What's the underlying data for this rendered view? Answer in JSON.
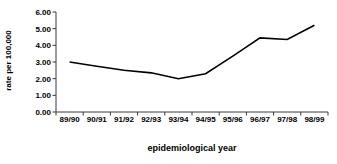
{
  "chart_data": {
    "type": "line",
    "title": "",
    "subtitle": "",
    "xlabel": "epidemiological year",
    "ylabel": "rate per 100,000",
    "categories": [
      "89/90",
      "90/91",
      "91/92",
      "92/93",
      "93/94",
      "94/95",
      "95/96",
      "96/97",
      "97/98",
      "98/99"
    ],
    "values": [
      3.0,
      2.75,
      2.5,
      2.35,
      2.0,
      2.3,
      3.35,
      4.45,
      4.35,
      5.2
    ],
    "series": [
      {
        "name": "rate per 100,000",
        "values": [
          3.0,
          2.75,
          2.5,
          2.35,
          2.0,
          2.3,
          3.35,
          4.45,
          4.35,
          5.2
        ]
      }
    ],
    "ylim": [
      0.0,
      6.0
    ],
    "ytick_step": 1.0,
    "ytick_labels": [
      "0.00",
      "1.00",
      "2.00",
      "3.00",
      "4.00",
      "5.00",
      "6.00"
    ],
    "ytick_values": [
      0,
      1,
      2,
      3,
      4,
      5,
      6
    ],
    "grid": false,
    "legend": false,
    "legend_position": "none",
    "line_color": "#000000",
    "axis_color": "#000000",
    "background_color": "#ffffff",
    "markers": false,
    "annotations": []
  }
}
